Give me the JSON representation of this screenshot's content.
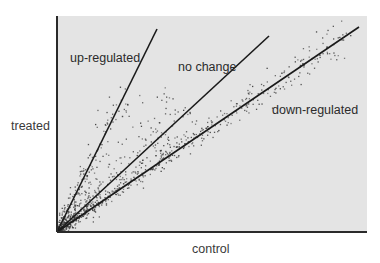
{
  "chart_data": {
    "type": "scatter",
    "title": "",
    "xlabel": "control",
    "ylabel": "treated",
    "grid": false,
    "legend": null,
    "axis_ticks": "none",
    "plot_area": {
      "left": 57,
      "top": 16,
      "right": 367,
      "bottom": 232,
      "fill": "#e4e4e4"
    },
    "origin": [
      57,
      232
    ],
    "reference_lines": [
      {
        "name": "up-regulated",
        "end": [
          157,
          29
        ],
        "slope_ratio": 2.03
      },
      {
        "name": "no change",
        "end": [
          269,
          36
        ],
        "slope_ratio": 0.92
      },
      {
        "name": "down-regulated",
        "end": [
          359,
          27
        ],
        "slope_ratio": 0.68
      }
    ],
    "annotations": [
      {
        "text": "up-regulated",
        "x": 70,
        "y": 52
      },
      {
        "text": "no change",
        "x": 178,
        "y": 61
      },
      {
        "text": "down-regulated",
        "x": 272,
        "y": 104
      }
    ],
    "series": [
      {
        "name": "up-regulated genes",
        "along": "up-regulated",
        "count": 180,
        "extent": 0.72,
        "spread": 7,
        "density_bias": 2.2
      },
      {
        "name": "unchanged genes",
        "along": "no change",
        "count": 520,
        "extent": 0.62,
        "spread": 14,
        "density_bias": 2.6
      },
      {
        "name": "down-regulated genes",
        "along": "down-regulated",
        "count": 420,
        "extent": 0.97,
        "spread": 5,
        "density_bias": 1.4
      }
    ],
    "colors": {
      "points": "#3a3a3a",
      "lines": "#1a1a1a",
      "axes": "#2a2a2a",
      "background": "#e4e4e4"
    }
  },
  "labels": {
    "up": "up-regulated",
    "none": "no change",
    "down": "down-regulated",
    "xaxis": "control",
    "yaxis": "treated"
  }
}
